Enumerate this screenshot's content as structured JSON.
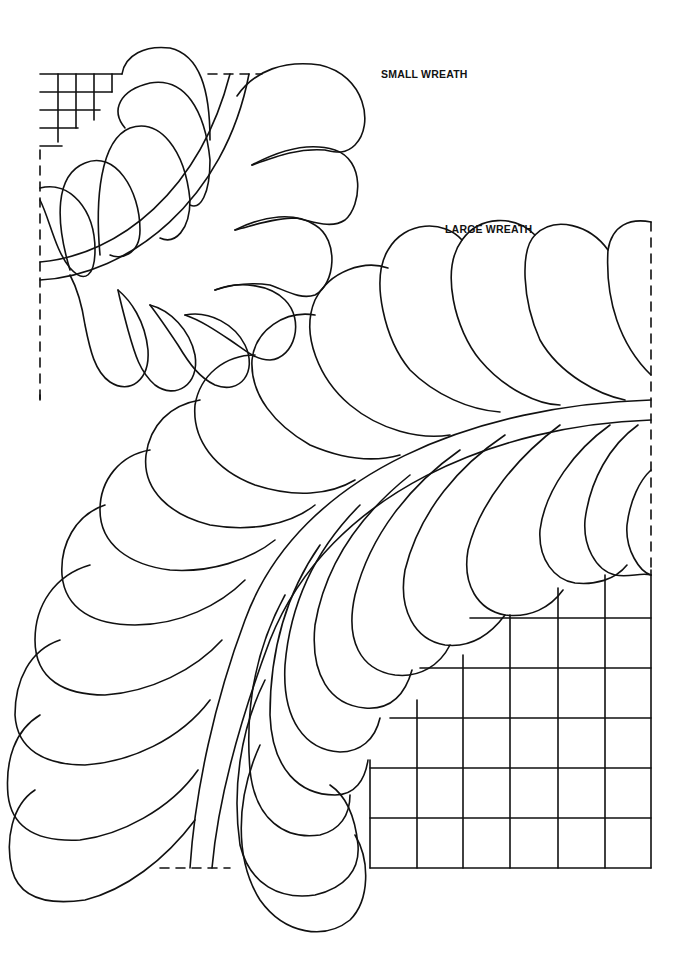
{
  "page": {
    "background": "#ffffff",
    "ink_color": "#111111"
  },
  "labels": {
    "small_wreath": "SMALL WREATH",
    "large_wreath": "LARGE WREATH"
  },
  "small_wreath": {
    "grid": {
      "x": 40,
      "y": 74,
      "cols": 5,
      "rows": 4,
      "cell": 18
    },
    "frame": {
      "left": 40,
      "top": 74,
      "right": 262,
      "bottom": 400
    }
  },
  "large_wreath": {
    "grid": {
      "x_lines": [
        370,
        417,
        463,
        510,
        558,
        605,
        651
      ],
      "y_lines": [
        618,
        668,
        718,
        768,
        818,
        868
      ]
    },
    "frame": {
      "left": 160,
      "top": 222,
      "right": 651,
      "bottom": 868
    }
  }
}
